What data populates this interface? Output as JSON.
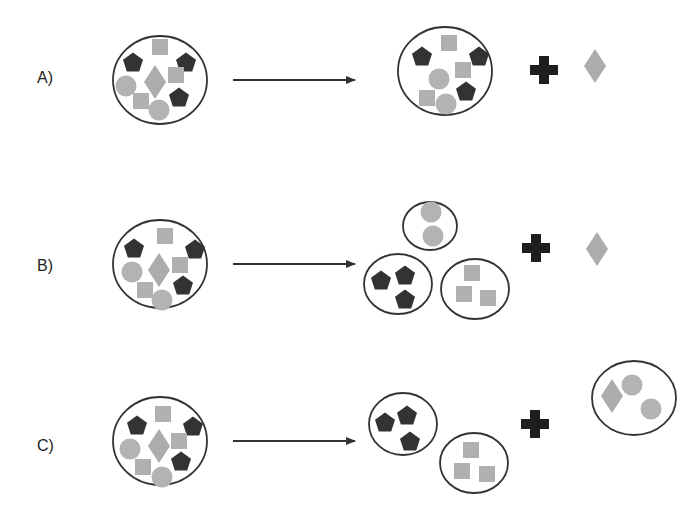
{
  "colors": {
    "outline": "#333333",
    "pentagon": "#333333",
    "cross": "#1e1e1e",
    "square": "#b0b0b0",
    "circle": "#b3b3b3",
    "diamond": "#acacac",
    "arrow": "#333333"
  },
  "rows": [
    {
      "label": "A)",
      "label_pos": [
        37,
        83
      ],
      "arrow": {
        "x1": 233,
        "x2": 355,
        "y": 80
      },
      "before": {
        "cx": 160,
        "cy": 80,
        "rx": 47,
        "ry": 44,
        "items": [
          {
            "t": "pentagon",
            "x": 133,
            "y": 62
          },
          {
            "t": "square",
            "x": 160,
            "y": 47
          },
          {
            "t": "pentagon",
            "x": 186,
            "y": 62
          },
          {
            "t": "circle",
            "x": 126,
            "y": 86
          },
          {
            "t": "diamond",
            "x": 155,
            "y": 82
          },
          {
            "t": "square",
            "x": 176,
            "y": 75
          },
          {
            "t": "square",
            "x": 141,
            "y": 101
          },
          {
            "t": "pentagon",
            "x": 179,
            "y": 97
          },
          {
            "t": "circle",
            "x": 159,
            "y": 110
          }
        ]
      },
      "after_groups": [
        {
          "cx": 445,
          "cy": 71,
          "rx": 47,
          "ry": 44,
          "items": [
            {
              "t": "pentagon",
              "x": 422,
              "y": 56
            },
            {
              "t": "square",
              "x": 449,
              "y": 43
            },
            {
              "t": "pentagon",
              "x": 479,
              "y": 56
            },
            {
              "t": "circle",
              "x": 439,
              "y": 79
            },
            {
              "t": "square",
              "x": 463,
              "y": 70
            },
            {
              "t": "pentagon",
              "x": 466,
              "y": 91
            },
            {
              "t": "square",
              "x": 427,
              "y": 98
            },
            {
              "t": "circle",
              "x": 446,
              "y": 104
            }
          ]
        }
      ],
      "loose": [
        {
          "t": "cross",
          "x": 544,
          "y": 70
        },
        {
          "t": "diamond",
          "x": 595,
          "y": 66
        }
      ]
    },
    {
      "label": "B)",
      "label_pos": [
        37,
        271
      ],
      "arrow": {
        "x1": 233,
        "x2": 355,
        "y": 264
      },
      "before": {
        "cx": 160,
        "cy": 264,
        "rx": 47,
        "ry": 44,
        "items": [
          {
            "t": "pentagon",
            "x": 134,
            "y": 248
          },
          {
            "t": "square",
            "x": 165,
            "y": 236
          },
          {
            "t": "pentagon",
            "x": 195,
            "y": 249
          },
          {
            "t": "circle",
            "x": 132,
            "y": 272
          },
          {
            "t": "diamond",
            "x": 159,
            "y": 270
          },
          {
            "t": "square",
            "x": 180,
            "y": 265
          },
          {
            "t": "square",
            "x": 145,
            "y": 290
          },
          {
            "t": "pentagon",
            "x": 183,
            "y": 285
          },
          {
            "t": "circle",
            "x": 162,
            "y": 300
          }
        ]
      },
      "after_groups": [
        {
          "cx": 430,
          "cy": 226,
          "rx": 27,
          "ry": 24,
          "items": [
            {
              "t": "circle",
              "x": 431,
              "y": 212
            },
            {
              "t": "circle",
              "x": 433,
              "y": 236
            }
          ]
        },
        {
          "cx": 398,
          "cy": 284,
          "rx": 34,
          "ry": 30,
          "items": [
            {
              "t": "pentagon",
              "x": 381,
              "y": 280
            },
            {
              "t": "pentagon",
              "x": 405,
              "y": 275
            },
            {
              "t": "pentagon",
              "x": 405,
              "y": 299
            }
          ]
        },
        {
          "cx": 475,
          "cy": 289,
          "rx": 34,
          "ry": 30,
          "items": [
            {
              "t": "square",
              "x": 472,
              "y": 273
            },
            {
              "t": "square",
              "x": 464,
              "y": 294
            },
            {
              "t": "square",
              "x": 488,
              "y": 298
            }
          ]
        }
      ],
      "loose": [
        {
          "t": "cross",
          "x": 536,
          "y": 248
        },
        {
          "t": "diamond",
          "x": 597,
          "y": 249
        }
      ]
    },
    {
      "label": "C)",
      "label_pos": [
        37,
        451
      ],
      "arrow": {
        "x1": 233,
        "x2": 355,
        "y": 441
      },
      "before": {
        "cx": 160,
        "cy": 441,
        "rx": 47,
        "ry": 44,
        "items": [
          {
            "t": "pentagon",
            "x": 137,
            "y": 425
          },
          {
            "t": "square",
            "x": 163,
            "y": 414
          },
          {
            "t": "pentagon",
            "x": 193,
            "y": 426
          },
          {
            "t": "circle",
            "x": 130,
            "y": 449
          },
          {
            "t": "diamond",
            "x": 159,
            "y": 446
          },
          {
            "t": "square",
            "x": 179,
            "y": 441
          },
          {
            "t": "square",
            "x": 143,
            "y": 467
          },
          {
            "t": "pentagon",
            "x": 181,
            "y": 461
          },
          {
            "t": "circle",
            "x": 162,
            "y": 477
          }
        ]
      },
      "after_groups": [
        {
          "cx": 403,
          "cy": 424,
          "rx": 34,
          "ry": 31,
          "items": [
            {
              "t": "pentagon",
              "x": 385,
              "y": 422
            },
            {
              "t": "pentagon",
              "x": 407,
              "y": 415
            },
            {
              "t": "pentagon",
              "x": 410,
              "y": 441
            }
          ]
        },
        {
          "cx": 474,
          "cy": 463,
          "rx": 34,
          "ry": 30,
          "items": [
            {
              "t": "square",
              "x": 471,
              "y": 450
            },
            {
              "t": "square",
              "x": 462,
              "y": 471
            },
            {
              "t": "square",
              "x": 487,
              "y": 474
            }
          ]
        },
        {
          "cx": 634,
          "cy": 398,
          "rx": 42,
          "ry": 37,
          "items": [
            {
              "t": "diamond",
              "x": 612,
              "y": 396
            },
            {
              "t": "circle",
              "x": 632,
              "y": 385
            },
            {
              "t": "circle",
              "x": 651,
              "y": 409
            }
          ]
        }
      ],
      "loose": [
        {
          "t": "cross",
          "x": 535,
          "y": 424
        }
      ]
    }
  ]
}
